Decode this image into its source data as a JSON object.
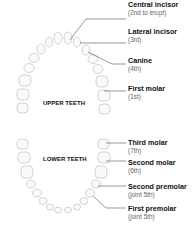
{
  "diagram": {
    "arches": [
      {
        "id": "upper",
        "label": "UPPER TEETH"
      },
      {
        "id": "lower",
        "label": "LOWER TEETH"
      }
    ],
    "upper_labels": [
      {
        "name": "Central incisor",
        "order": "(2nd to erupt)"
      },
      {
        "name": "Lateral incisor",
        "order": "(3rd)"
      },
      {
        "name": "Canine",
        "order": "(4th)"
      },
      {
        "name": "First molar",
        "order": "(1st)"
      }
    ],
    "lower_labels": [
      {
        "name": "Third molar",
        "order": "(7th)"
      },
      {
        "name": "Second molar",
        "order": "(6th)"
      },
      {
        "name": "Second premolar",
        "order": "(joint 5th)"
      },
      {
        "name": "First premolar",
        "order": "(joint 5th)"
      }
    ],
    "colors": {
      "tooth_outline": "#c8c8c8",
      "tooth_fill": "#fafafa",
      "leader_line": "#555555",
      "label_text": "#111111",
      "sub_text": "#666666"
    }
  }
}
